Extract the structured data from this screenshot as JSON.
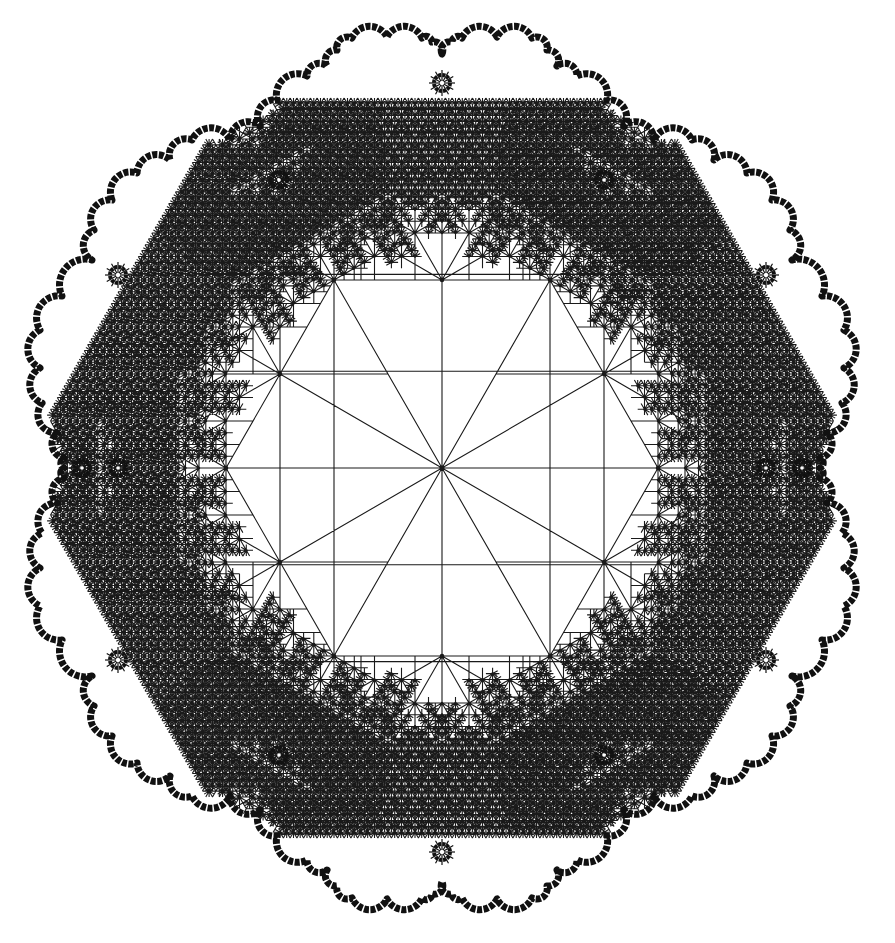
{
  "figure": {
    "title": "Self-similar 12-fold star tessellation (fractal limit-set tiling)",
    "width": 895,
    "height": 943,
    "background": "#ffffff",
    "line_color": "#1a1a1a",
    "boundary_color": "#111111",
    "center": [
      442,
      468
    ],
    "lattice_unit_x": 54,
    "lattice_unit_y": 94,
    "ray_count": 12,
    "ray_angle_step_deg": 30,
    "ray_length_factors": [
      4,
      3.4641,
      4,
      3.4641,
      4,
      3.4641,
      4,
      3.4641,
      4,
      3.4641,
      4,
      3.4641
    ],
    "child_scale": 0.5,
    "min_unit_px": 1.6,
    "max_depth": 7,
    "quarter_outline": [
      [
        0,
        -414
      ],
      [
        10,
        -426
      ],
      [
        20,
        -430
      ],
      [
        55,
        -431
      ],
      [
        90,
        -430
      ],
      [
        105,
        -418
      ],
      [
        115,
        -402
      ],
      [
        135,
        -392
      ],
      [
        165,
        -368
      ],
      [
        182,
        -342
      ],
      [
        212,
        -328
      ],
      [
        250,
        -328
      ],
      [
        272,
        -308
      ],
      [
        305,
        -295
      ],
      [
        330,
        -268
      ],
      [
        348,
        -238
      ],
      [
        350,
        -208
      ],
      [
        380,
        -172
      ],
      [
        402,
        -138
      ],
      [
        402,
        -100
      ],
      [
        400,
        -65
      ],
      [
        385,
        -35
      ],
      [
        378,
        -10
      ],
      [
        378,
        0
      ]
    ],
    "rosettes": [
      [
        442,
        83
      ],
      [
        279,
        180
      ],
      [
        604,
        180
      ],
      [
        118,
        275
      ],
      [
        766,
        275
      ],
      [
        82,
        468
      ],
      [
        118,
        468
      ],
      [
        766,
        468
      ],
      [
        802,
        468
      ],
      [
        118,
        660
      ],
      [
        766,
        660
      ],
      [
        279,
        755
      ],
      [
        604,
        755
      ],
      [
        442,
        852
      ]
    ],
    "rosette_radius": 8
  }
}
